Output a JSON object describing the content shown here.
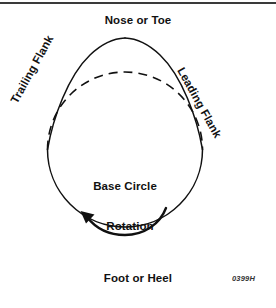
{
  "figure": {
    "title_top": "Nose or Toe",
    "title_bottom": "Foot or Heel",
    "center_label": "Base Circle",
    "rotation_label": "Rotation",
    "left_flank_label": "Trailing Flank",
    "right_flank_label": "Leading Flank",
    "figure_number": "0399H",
    "colors": {
      "outline": "#111111",
      "dashed_arc": "#111111",
      "rule": "#3a3a3a",
      "text": "#111111",
      "background": "#ffffff"
    },
    "geometry": {
      "base_circle_center_x": 125,
      "base_circle_center_y": 196,
      "base_circle_radius": 68,
      "nose_apex_x": 125,
      "nose_apex_y": 38,
      "flank_tangent_left_x": 47,
      "flank_tangent_left_y": 150,
      "flank_tangent_right_x": 203,
      "flank_tangent_right_y": 150
    },
    "icons": {
      "rotation_arrow": "curved-arrow-counterclockwise-icon",
      "dashed_arc": "dashed-arc-icon"
    }
  }
}
